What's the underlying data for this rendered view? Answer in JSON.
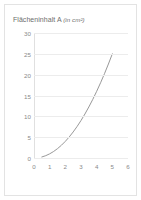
{
  "chart_data": {
    "type": "line",
    "title": "Flächeninhalt A (in cm²)",
    "title_main": "Flächeninhalt A",
    "title_unit": "(in cm²)",
    "xlabel": "",
    "ylabel": "",
    "xlim": [
      0,
      6
    ],
    "ylim": [
      0,
      30
    ],
    "grid": true,
    "grid_axis": "y",
    "legend": "none",
    "series": [
      {
        "name": "Flächeninhalt A",
        "function": "A = x²",
        "color": "#8c8c8c",
        "x": [
          0.5,
          0.75,
          1.0,
          1.25,
          1.5,
          1.75,
          2.0,
          2.25,
          2.5,
          2.75,
          3.0,
          3.25,
          3.5,
          3.75,
          4.0,
          4.25,
          4.5,
          4.75,
          5.0
        ],
        "values": [
          0.25,
          0.56,
          1.0,
          1.56,
          2.25,
          3.06,
          4.0,
          5.06,
          6.25,
          7.56,
          9.0,
          10.56,
          12.25,
          14.06,
          16.0,
          18.06,
          20.25,
          22.56,
          25.0
        ]
      }
    ],
    "xticks": [
      0,
      1,
      2,
      3,
      4,
      5,
      6
    ],
    "xtick_labels": [
      "0",
      "1",
      "2",
      "3",
      "4",
      "5",
      "6"
    ],
    "yticks": [
      0,
      5,
      10,
      15,
      20,
      25,
      30
    ],
    "ytick_labels": [
      "0",
      "5",
      "10",
      "15",
      "20",
      "25",
      "30"
    ]
  },
  "style": {
    "curve_color": "#8c8c8c",
    "grid_color": "#ececec",
    "axis_color": "#e0e0e0",
    "tick_text_color": "#8a8a8a",
    "title_color": "#6d6d6d",
    "border_color": "#e3e3e3",
    "background": "#ffffff"
  }
}
